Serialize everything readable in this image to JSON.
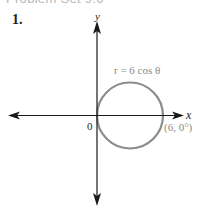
{
  "section_heading": "Problem Set 9.6",
  "problem": {
    "number": "1."
  },
  "figure": {
    "type": "polar-graph",
    "axes": {
      "x_label": "x",
      "y_label": "y",
      "origin_label": "0"
    },
    "curve": {
      "equation": "r = 6 cos θ",
      "shape": "circle",
      "color": "#8c8c8c"
    },
    "point": {
      "label": "(6, 0°)"
    },
    "colors": {
      "axis": "#1a1a1a",
      "curve": "#8c8c8c",
      "label_gray": "#8a8a8a"
    }
  }
}
